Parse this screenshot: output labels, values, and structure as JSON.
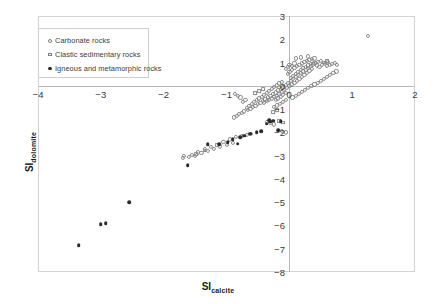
{
  "chart_data": {
    "type": "scatter",
    "title": "",
    "xlabel": "SI calcite",
    "xlabel_base": "SI",
    "xlabel_sub": "calcite",
    "ylabel": "SI dolomite",
    "ylabel_base": "SI",
    "ylabel_sub": "dolomite",
    "xlim": [
      -4,
      2
    ],
    "ylim": [
      -8,
      3
    ],
    "xticks": [
      -4,
      -3,
      -2,
      -1,
      0,
      1,
      2
    ],
    "xtick_labels": [
      "−4",
      "−3",
      "−2",
      "−1",
      "0",
      "1",
      "2"
    ],
    "yticks": [
      3,
      2,
      1,
      0,
      -1,
      -2,
      -3,
      -4,
      -5,
      -6,
      -7,
      -8
    ],
    "ytick_labels": [
      "3",
      "2",
      "1",
      "0",
      "−1",
      "−2",
      "−3",
      "−4",
      "−5",
      "−6",
      "−7",
      "−8"
    ],
    "grid": false,
    "legend_position": "upper-left",
    "axis_color": "#b9b9b9",
    "marker_open_color": "#8b8b8b",
    "marker_filled_color": "#2b2b2b",
    "legend": [
      {
        "label": "Carbonate rocks",
        "marker": "open-circle",
        "icon": "open-circle-marker-icon"
      },
      {
        "label": "Clastic sedimentary rocks",
        "marker": "open-square",
        "icon": "open-square-marker-icon"
      },
      {
        "label": "Igneous and metamorphic rocks",
        "marker": "filled-circle",
        "icon": "filled-circle-marker-icon"
      }
    ],
    "series": [
      {
        "name": "Carbonate rocks",
        "marker": "open-circle",
        "points": [
          [
            -0.05,
            0.05
          ],
          [
            -0.02,
            0.12
          ],
          [
            0.02,
            0.2
          ],
          [
            0.06,
            0.3
          ],
          [
            0.1,
            0.38
          ],
          [
            0.14,
            0.46
          ],
          [
            0.18,
            0.55
          ],
          [
            0.22,
            0.62
          ],
          [
            0.26,
            0.7
          ],
          [
            0.3,
            0.78
          ],
          [
            0.34,
            0.86
          ],
          [
            0.38,
            0.92
          ],
          [
            0.42,
            0.98
          ],
          [
            0.46,
            1.02
          ],
          [
            0.5,
            1.06
          ],
          [
            -0.1,
            -0.05
          ],
          [
            -0.14,
            -0.12
          ],
          [
            -0.18,
            -0.2
          ],
          [
            -0.22,
            -0.28
          ],
          [
            -0.26,
            -0.36
          ],
          [
            -0.3,
            -0.44
          ],
          [
            -0.34,
            -0.5
          ],
          [
            -0.38,
            -0.58
          ],
          [
            -0.42,
            -0.64
          ],
          [
            -0.46,
            -0.72
          ],
          [
            -0.5,
            -0.78
          ],
          [
            -0.54,
            -0.86
          ],
          [
            -0.58,
            -0.92
          ],
          [
            -0.62,
            -0.98
          ],
          [
            -0.66,
            -1.04
          ],
          [
            0.0,
            -0.02
          ],
          [
            0.04,
            0.06
          ],
          [
            0.08,
            0.14
          ],
          [
            0.12,
            0.22
          ],
          [
            0.16,
            0.3
          ],
          [
            -0.04,
            -0.1
          ],
          [
            -0.08,
            -0.18
          ],
          [
            -0.12,
            -0.26
          ],
          [
            -0.16,
            -0.34
          ],
          [
            -0.2,
            -0.42
          ],
          [
            0.2,
            0.4
          ],
          [
            0.24,
            0.48
          ],
          [
            0.28,
            0.56
          ],
          [
            0.32,
            0.64
          ],
          [
            0.36,
            0.72
          ],
          [
            -0.24,
            -0.48
          ],
          [
            -0.28,
            -0.54
          ],
          [
            -0.32,
            -0.6
          ],
          [
            -0.36,
            -0.66
          ],
          [
            -0.4,
            -0.72
          ],
          [
            0.02,
            0.34
          ],
          [
            0.06,
            0.44
          ],
          [
            0.1,
            0.52
          ],
          [
            0.14,
            0.6
          ],
          [
            0.18,
            0.68
          ],
          [
            -0.06,
            -0.3
          ],
          [
            -0.1,
            -0.38
          ],
          [
            -0.14,
            -0.46
          ],
          [
            -0.18,
            -0.54
          ],
          [
            -0.22,
            -0.62
          ],
          [
            0.22,
            0.76
          ],
          [
            0.26,
            0.82
          ],
          [
            0.3,
            0.88
          ],
          [
            0.34,
            0.94
          ],
          [
            0.4,
            1.0
          ],
          [
            0.44,
            0.88
          ],
          [
            0.48,
            0.82
          ],
          [
            0.52,
            0.9
          ],
          [
            0.56,
            0.94
          ],
          [
            0.6,
            0.86
          ],
          [
            0.64,
            0.9
          ],
          [
            0.68,
            0.94
          ],
          [
            0.72,
            0.98
          ],
          [
            0.76,
            0.9
          ],
          [
            0.62,
            1.04
          ],
          [
            -0.02,
            0.52
          ],
          [
            0.0,
            0.6
          ],
          [
            0.04,
            0.68
          ],
          [
            0.08,
            0.76
          ],
          [
            0.12,
            0.84
          ],
          [
            0.16,
            0.9
          ],
          [
            0.2,
            0.96
          ],
          [
            0.24,
            1.02
          ],
          [
            0.28,
            1.08
          ],
          [
            0.32,
            1.12
          ],
          [
            0.1,
            1.18
          ],
          [
            0.18,
            1.22
          ],
          [
            0.3,
            1.26
          ],
          [
            0.36,
            1.14
          ],
          [
            0.4,
            1.18
          ],
          [
            -0.12,
            0.18
          ],
          [
            -0.16,
            0.1
          ],
          [
            -0.2,
            0.02
          ],
          [
            -0.24,
            -0.06
          ],
          [
            -0.28,
            -0.14
          ],
          [
            -0.32,
            -0.22
          ],
          [
            -0.36,
            -0.3
          ],
          [
            -0.4,
            -0.38
          ],
          [
            -0.44,
            -0.46
          ],
          [
            -0.48,
            -0.54
          ],
          [
            -0.52,
            -0.62
          ],
          [
            -0.56,
            -0.7
          ],
          [
            -0.6,
            -0.78
          ],
          [
            -0.64,
            -0.86
          ],
          [
            -0.68,
            -0.94
          ],
          [
            -0.05,
            -0.6
          ],
          [
            -0.1,
            -0.68
          ],
          [
            -0.15,
            -0.76
          ],
          [
            -0.2,
            -0.84
          ],
          [
            -0.25,
            -0.92
          ],
          [
            0.05,
            -0.5
          ],
          [
            0.1,
            -0.42
          ],
          [
            0.15,
            -0.34
          ],
          [
            0.2,
            -0.26
          ],
          [
            0.25,
            -0.18
          ],
          [
            0.3,
            -0.1
          ],
          [
            0.35,
            -0.02
          ],
          [
            0.4,
            0.06
          ],
          [
            0.45,
            0.14
          ],
          [
            0.5,
            0.22
          ],
          [
            0.55,
            0.3
          ],
          [
            0.6,
            0.38
          ],
          [
            0.65,
            0.46
          ],
          [
            0.7,
            0.54
          ],
          [
            0.75,
            0.62
          ],
          [
            -0.72,
            -1.1
          ],
          [
            -0.76,
            -1.16
          ],
          [
            -0.8,
            -1.22
          ],
          [
            -0.84,
            -1.3
          ],
          [
            -0.88,
            -1.36
          ],
          [
            -0.7,
            -0.6
          ],
          [
            -0.74,
            -0.68
          ],
          [
            -0.78,
            -0.5
          ],
          [
            -0.82,
            -0.42
          ],
          [
            -0.86,
            -0.34
          ],
          [
            -0.3,
            -1.6
          ],
          [
            -0.24,
            -1.66
          ],
          [
            -0.36,
            -1.54
          ],
          [
            -0.12,
            -1.95
          ],
          [
            -0.06,
            -2.0
          ],
          [
            1.25,
            2.15
          ],
          [
            -1.1,
            -2.6
          ],
          [
            -1.2,
            -2.7
          ],
          [
            -1.3,
            -2.8
          ],
          [
            -1.4,
            -2.9
          ],
          [
            -1.5,
            -3.0
          ],
          [
            -1.6,
            -3.05
          ],
          [
            -1.7,
            -3.1
          ],
          [
            -1.05,
            -2.4
          ],
          [
            -0.95,
            -2.3
          ],
          [
            -0.85,
            -2.2
          ],
          [
            -0.75,
            -2.15
          ],
          [
            -0.68,
            -2.1
          ],
          [
            -0.62,
            -2.05
          ],
          [
            -0.9,
            -2.45
          ],
          [
            -1.0,
            -2.55
          ],
          [
            -1.25,
            -2.62
          ],
          [
            -1.35,
            -2.72
          ],
          [
            -1.45,
            -2.86
          ],
          [
            -1.55,
            -2.96
          ],
          [
            -1.68,
            -3.02
          ],
          [
            0.0,
            0.9
          ],
          [
            -0.02,
            0.82
          ],
          [
            0.04,
            0.86
          ],
          [
            0.08,
            0.96
          ],
          [
            -0.06,
            0.74
          ]
        ]
      },
      {
        "name": "Clastic sedimentary rocks",
        "marker": "open-square",
        "points": [
          [
            -0.2,
            -1.05
          ],
          [
            -0.26,
            -1.12
          ],
          [
            -0.16,
            -1.5
          ],
          [
            -0.1,
            -1.58
          ],
          [
            -0.42,
            -0.15
          ],
          [
            -0.48,
            -0.22
          ],
          [
            -0.55,
            -0.3
          ],
          [
            -1.15,
            -2.55
          ],
          [
            -1.35,
            -2.78
          ],
          [
            -1.48,
            -2.92
          ],
          [
            0.55,
            1.0
          ],
          [
            0.6,
            1.05
          ]
        ]
      },
      {
        "name": "Igneous and metamorphic rocks",
        "marker": "filled-circle",
        "points": [
          [
            -3.35,
            -6.85
          ],
          [
            -3.0,
            -5.95
          ],
          [
            -2.92,
            -5.9
          ],
          [
            -2.55,
            -5.0
          ],
          [
            -0.62,
            -2.05
          ],
          [
            -0.72,
            -2.15
          ],
          [
            -0.78,
            -2.2
          ],
          [
            -0.9,
            -2.3
          ],
          [
            -0.45,
            -1.95
          ],
          [
            -0.52,
            -2.0
          ],
          [
            -0.3,
            -1.55
          ],
          [
            -0.36,
            -1.62
          ],
          [
            -0.26,
            -1.5
          ],
          [
            -0.32,
            -1.48
          ],
          [
            -0.18,
            -1.9
          ],
          [
            -0.14,
            -1.52
          ],
          [
            -1.62,
            -3.4
          ],
          [
            -1.12,
            -2.52
          ],
          [
            -0.98,
            -2.42
          ],
          [
            -1.3,
            -2.5
          ],
          [
            -0.82,
            -2.48
          ]
        ]
      }
    ]
  }
}
